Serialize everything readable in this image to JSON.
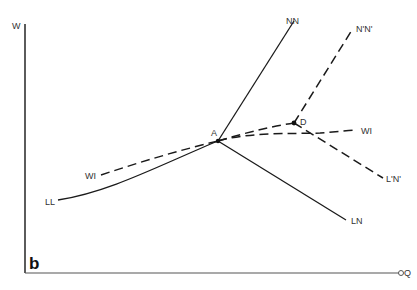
{
  "diagram": {
    "panel_label": "b",
    "axes": {
      "y_label": "W",
      "x_label": "Q"
    },
    "points": {
      "A": "A",
      "D": "D"
    },
    "curves": [
      {
        "id": "NN",
        "label": "NN",
        "style": "solid"
      },
      {
        "id": "N'N'",
        "label": "N'N'",
        "style": "dashed"
      },
      {
        "id": "WI-left",
        "label": "WI",
        "style": "dashed"
      },
      {
        "id": "WI-right",
        "label": "WI",
        "style": "dashed"
      },
      {
        "id": "LL",
        "label": "LL",
        "style": "solid"
      },
      {
        "id": "LN",
        "label": "LN",
        "style": "solid"
      },
      {
        "id": "L'N'",
        "label": "L'N'",
        "style": "dashed"
      }
    ],
    "colors": {
      "line": "#1a1a1a",
      "axis": "#333333",
      "text": "#333333"
    }
  }
}
